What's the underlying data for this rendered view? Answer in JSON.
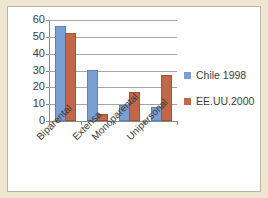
{
  "chart_data": {
    "type": "bar",
    "title": "",
    "subtitle": "",
    "xlabel": "",
    "ylabel": "",
    "categories": [
      "Biparental",
      "Extensa",
      "Monoparental",
      "Unipersonal"
    ],
    "series": [
      {
        "name": "Chile 1998",
        "color": "#7b9fd4",
        "values": [
          55,
          29,
          8.5,
          7
        ]
      },
      {
        "name": "EE.UU.2000",
        "color": "#c0694a",
        "values": [
          51,
          3,
          16,
          26
        ]
      }
    ],
    "ylim": [
      0,
      60
    ],
    "ytick_labels": [
      "60",
      "50",
      "40",
      "30",
      "20",
      "10",
      "0"
    ],
    "ytick_values": [
      60,
      50,
      40,
      30,
      20,
      10,
      0
    ],
    "ytick_step": 10,
    "grid": true,
    "grid_axis": "y",
    "legend_position": "right",
    "category_label_rotation": -45,
    "bar_orientation": "vertical",
    "grouping": "clustered"
  },
  "legend": {
    "entries": [
      {
        "label": "Chile 1998",
        "color": "#7b9fd4"
      },
      {
        "label": "EE.UU.2000",
        "color": "#c0694a"
      }
    ]
  },
  "axis": {
    "y_labels": [
      "60",
      "50",
      "40",
      "30",
      "20",
      "10",
      "0"
    ]
  },
  "colors": {
    "series_chile": "#7b9fd4",
    "series_eeuu": "#c0694a",
    "frame_background": "#eee6d0",
    "plot_background": "#ffffff",
    "gridline": "#a6a6a6",
    "text": "#3b3b3b"
  }
}
